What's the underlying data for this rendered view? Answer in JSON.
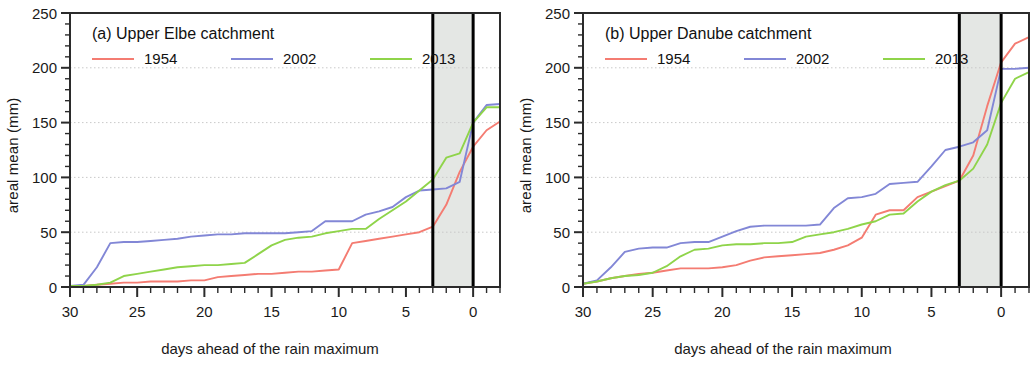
{
  "figure": {
    "background": "#ffffff",
    "panel_count": 2
  },
  "axis_common": {
    "ylabel": "areal mean (mm)",
    "xlabel": "days ahead of the rain maximum",
    "ytick_labels": [
      "0",
      "50",
      "100",
      "150",
      "200",
      "250"
    ],
    "xtick_labels": [
      "30",
      "25",
      "20",
      "15",
      "10",
      "5",
      "0"
    ],
    "grid_color": "#c9c9c9",
    "frame_color": "#2b2b2b",
    "shade_color": "#e4e7e4",
    "marker_line_color": "#000000"
  },
  "legend": {
    "entries": [
      {
        "label": "1954",
        "color": "#f47c72"
      },
      {
        "label": "2002",
        "color": "#8287d6"
      },
      {
        "label": "2013",
        "color": "#8fd44a"
      }
    ]
  },
  "panels": [
    {
      "id": "a",
      "title": "(a) Upper Elbe catchment"
    },
    {
      "id": "b",
      "title": "(b) Upper Danube catchment"
    }
  ],
  "chart_data": [
    {
      "type": "line",
      "panel": "a",
      "title": "(a) Upper Elbe catchment",
      "xlabel": "days ahead of the rain maximum",
      "ylabel": "areal mean (mm)",
      "xlim": [
        30,
        -2
      ],
      "ylim": [
        0,
        250
      ],
      "x_inverted": true,
      "grid": true,
      "yticks": [
        0,
        50,
        100,
        150,
        200,
        250
      ],
      "xticks": [
        30,
        25,
        20,
        15,
        10,
        5,
        0
      ],
      "minor_xtick_interval": 1,
      "minor_ytick_interval": 10,
      "legend_position": "top-left-inside",
      "annotations": [
        {
          "type": "vline",
          "x": 3,
          "style": "thick-black"
        },
        {
          "type": "vline",
          "x": 0,
          "style": "thick-black"
        },
        {
          "type": "shaded-band",
          "x_from": 3,
          "x_to": 0,
          "color": "#e4e7e4"
        }
      ],
      "series": [
        {
          "name": "1954",
          "color": "#f47c72",
          "x": [
            30,
            29,
            28,
            27,
            26,
            25,
            24,
            23,
            22,
            21,
            20,
            19,
            18,
            17,
            16,
            15,
            14,
            13,
            12,
            11,
            10,
            9,
            8,
            7,
            6,
            5,
            4,
            3,
            2,
            1,
            0,
            -1,
            -2
          ],
          "y": [
            1,
            1,
            2,
            3,
            4,
            4,
            5,
            5,
            5,
            6,
            6,
            9,
            10,
            11,
            12,
            12,
            13,
            14,
            14,
            15,
            16,
            40,
            42,
            44,
            46,
            48,
            50,
            55,
            75,
            105,
            128,
            143,
            151
          ]
        },
        {
          "name": "2002",
          "color": "#8287d6",
          "x": [
            30,
            29,
            28,
            27,
            26,
            25,
            24,
            23,
            22,
            21,
            20,
            19,
            18,
            17,
            16,
            15,
            14,
            13,
            12,
            11,
            10,
            9,
            8,
            7,
            6,
            5,
            4,
            3,
            2,
            1,
            0,
            -1,
            -2
          ],
          "y": [
            1,
            2,
            18,
            40,
            41,
            41,
            42,
            43,
            44,
            46,
            47,
            48,
            48,
            49,
            49,
            49,
            49,
            50,
            51,
            60,
            60,
            60,
            66,
            69,
            73,
            82,
            88,
            89,
            90,
            96,
            150,
            166,
            167
          ]
        },
        {
          "name": "2013",
          "color": "#8fd44a",
          "x": [
            30,
            29,
            28,
            27,
            26,
            25,
            24,
            23,
            22,
            21,
            20,
            19,
            18,
            17,
            16,
            15,
            14,
            13,
            12,
            11,
            10,
            9,
            8,
            7,
            6,
            5,
            4,
            3,
            2,
            1,
            0,
            -1,
            -2
          ],
          "y": [
            1,
            1,
            2,
            4,
            10,
            12,
            14,
            16,
            18,
            19,
            20,
            20,
            21,
            22,
            30,
            38,
            43,
            45,
            46,
            49,
            51,
            53,
            53,
            62,
            70,
            78,
            88,
            98,
            118,
            122,
            150,
            164,
            164
          ]
        }
      ]
    },
    {
      "type": "line",
      "panel": "b",
      "title": "(b) Upper Danube catchment",
      "xlabel": "days ahead of the rain maximum",
      "ylabel": "areal mean (mm)",
      "xlim": [
        30,
        -2
      ],
      "ylim": [
        0,
        250
      ],
      "x_inverted": true,
      "grid": true,
      "yticks": [
        0,
        50,
        100,
        150,
        200,
        250
      ],
      "xticks": [
        30,
        25,
        20,
        15,
        10,
        5,
        0
      ],
      "minor_xtick_interval": 1,
      "minor_ytick_interval": 10,
      "legend_position": "top-left-inside",
      "annotations": [
        {
          "type": "vline",
          "x": 3,
          "style": "thick-black"
        },
        {
          "type": "vline",
          "x": 0,
          "style": "thick-black"
        },
        {
          "type": "shaded-band",
          "x_from": 3,
          "x_to": 0,
          "color": "#e4e7e4"
        }
      ],
      "series": [
        {
          "name": "1954",
          "color": "#f47c72",
          "x": [
            30,
            29,
            28,
            27,
            26,
            25,
            24,
            23,
            22,
            21,
            20,
            19,
            18,
            17,
            16,
            15,
            14,
            13,
            12,
            11,
            10,
            9,
            8,
            7,
            6,
            5,
            4,
            3,
            2,
            1,
            0,
            -1,
            -2
          ],
          "y": [
            3,
            5,
            8,
            10,
            12,
            13,
            15,
            17,
            17,
            17,
            18,
            20,
            24,
            27,
            28,
            29,
            30,
            31,
            34,
            38,
            45,
            66,
            70,
            70,
            82,
            87,
            92,
            97,
            120,
            165,
            205,
            222,
            228
          ]
        },
        {
          "name": "2002",
          "color": "#8287d6",
          "x": [
            30,
            29,
            28,
            27,
            26,
            25,
            24,
            23,
            22,
            21,
            20,
            19,
            18,
            17,
            16,
            15,
            14,
            13,
            12,
            11,
            10,
            9,
            8,
            7,
            6,
            5,
            4,
            3,
            2,
            1,
            0,
            -1,
            -2
          ],
          "y": [
            3,
            6,
            18,
            32,
            35,
            36,
            36,
            40,
            41,
            41,
            46,
            51,
            55,
            56,
            56,
            56,
            56,
            57,
            72,
            81,
            82,
            85,
            94,
            95,
            96,
            110,
            125,
            128,
            132,
            143,
            199,
            199,
            200
          ]
        },
        {
          "name": "2013",
          "color": "#8fd44a",
          "x": [
            30,
            29,
            28,
            27,
            26,
            25,
            24,
            23,
            22,
            21,
            20,
            19,
            18,
            17,
            16,
            15,
            14,
            13,
            12,
            11,
            10,
            9,
            8,
            7,
            6,
            5,
            4,
            3,
            2,
            1,
            0,
            -1,
            -2
          ],
          "y": [
            3,
            5,
            8,
            10,
            11,
            13,
            19,
            28,
            34,
            35,
            38,
            39,
            39,
            40,
            40,
            41,
            46,
            48,
            50,
            53,
            57,
            60,
            66,
            67,
            78,
            87,
            93,
            97,
            108,
            130,
            168,
            190,
            196
          ]
        }
      ]
    }
  ]
}
